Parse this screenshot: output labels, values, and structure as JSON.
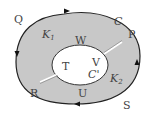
{
  "diagram": {
    "type": "annular-region-contour",
    "colors": {
      "region_fill": "#c8c8c8",
      "outer_stroke": "#222222",
      "inner_fill": "#ffffff",
      "inner_stroke": "#333333",
      "cut_line": "#ffffff",
      "label": "#444444"
    },
    "labels": {
      "Q": "Q",
      "P": "P",
      "R": "R",
      "S": "S",
      "W": "W",
      "T": "T",
      "U": "U",
      "V": "V",
      "C": "C",
      "C_prime": "C'",
      "K1": "K",
      "K1_sub": "1",
      "K2": "K",
      "K2_sub": "2"
    },
    "arrows": [
      {
        "location": "outer-top",
        "direction": "right"
      },
      {
        "location": "outer-left",
        "direction": "down"
      },
      {
        "location": "outer-right",
        "direction": "up"
      },
      {
        "location": "outer-bottom",
        "direction": "left"
      }
    ],
    "cuts": [
      {
        "name": "cut-upper-right",
        "from": "inner-ellipse",
        "to": "outer-boundary-P"
      },
      {
        "name": "cut-lower-left",
        "from": "inner-ellipse",
        "to": "outer-boundary-R"
      }
    ]
  }
}
